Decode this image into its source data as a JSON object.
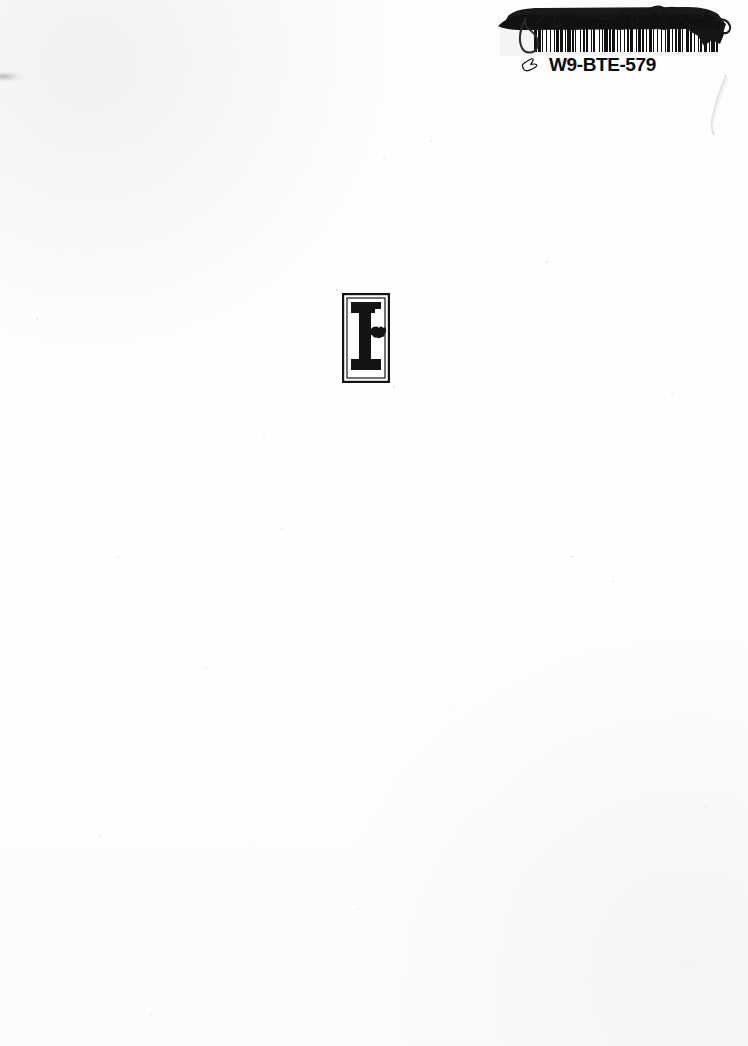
{
  "page": {
    "kind": "scanned-book-page",
    "background_color": "#fdfdfd",
    "width": 748,
    "height": 1046
  },
  "sticker": {
    "name": "barcode-sticker",
    "code_text": "W9-BTE-579",
    "manicule_icon": "pointing-hand-icon",
    "barcode_icon": "barcode-icon",
    "signature_icon": "handwritten-signature-icon",
    "signature_description": "Handwritten signature in heavy black ink over the sticker",
    "ink_color": "#111111",
    "label_color": "#f4f4f4",
    "bar_widths": [
      3,
      1,
      2,
      1,
      1,
      3,
      1,
      2,
      1,
      3,
      1,
      1,
      2,
      1,
      3,
      2,
      1,
      1,
      3,
      1,
      2,
      1,
      1,
      3,
      1,
      2,
      2,
      1,
      1,
      3,
      1,
      1,
      2,
      3,
      1,
      2,
      1,
      1,
      3,
      1,
      2,
      1,
      3,
      1,
      1,
      2,
      1,
      3,
      1,
      1,
      2,
      1,
      3,
      2,
      1,
      1,
      3,
      1,
      2,
      1,
      1,
      2,
      3,
      1,
      1,
      2,
      1,
      3,
      1,
      2,
      1,
      1,
      3,
      2,
      1,
      1,
      2,
      1,
      3,
      1,
      1,
      2,
      3,
      1,
      2,
      1,
      1,
      3,
      1,
      1,
      2,
      1,
      3,
      2,
      1,
      1,
      3,
      1,
      2,
      1
    ]
  },
  "colophon": {
    "name": "publisher-colophon",
    "letter": "F",
    "ornament_icon": "leaf-fleuron-icon",
    "description": "Bold slab-serif letter F with leaf ornament inside a rectangular frame",
    "ink_color": "#141414"
  },
  "artifacts": {
    "left_edge_smudge": "scan-smudge",
    "right_edge_curve": "scan-crease-line",
    "speckle_description": "Faint grey dust specks from scanning"
  }
}
